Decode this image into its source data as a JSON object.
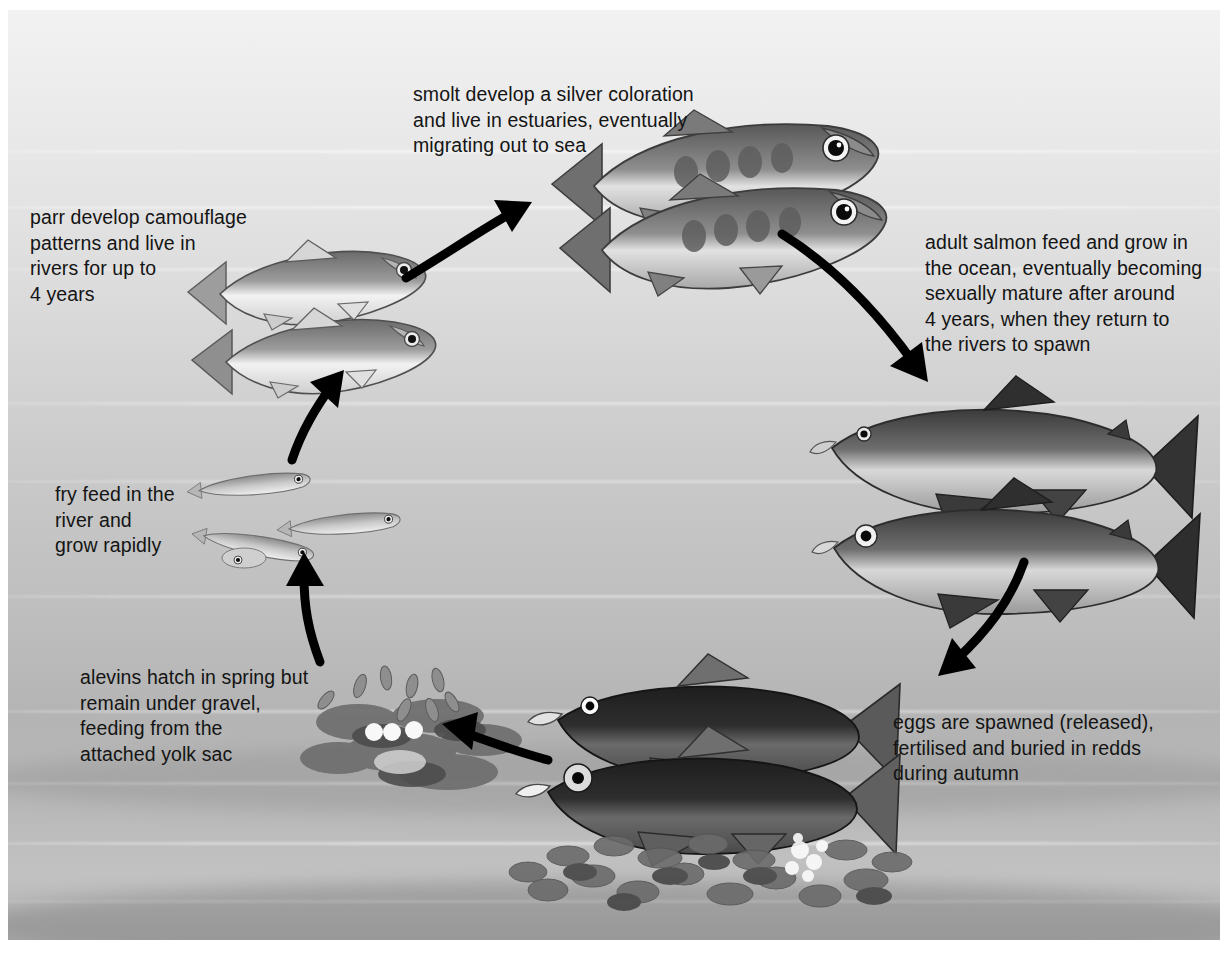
{
  "diagram": {
    "type": "cycle-diagram",
    "background": {
      "description": "underwater scene, grey gradient from pale surface to darker riverbed",
      "top_color": "#f2f2f2",
      "mid_color": "#c9c9c9",
      "bottom_color": "#b0b0b0",
      "wave_color": "#ffffff"
    },
    "arrow_color": "#000000",
    "text_color": "#141414",
    "stages": [
      {
        "id": "smolt",
        "label": "smolt develop a silver coloration\nand live in estuaries, eventually\nmigrating out to sea",
        "subject": "two smolt facing right with oval parr marks",
        "count": 2
      },
      {
        "id": "adult",
        "label": "adult salmon feed and grow in\nthe ocean, eventually becoming\nsexually mature after around\n4 years, when they return to\nthe rivers to spawn",
        "subject": "two large adult salmon facing left, dark backs and silver flanks",
        "count": 2
      },
      {
        "id": "eggs",
        "label": "eggs are spawned (released),\nfertilised and buried in redds\nduring autumn",
        "subject": "two spawning salmon over a gravel redd with eggs",
        "count": 2
      },
      {
        "id": "alevin",
        "label": "alevins hatch in spring but\nremain under gravel,\nfeeding from the\nattached yolk sac",
        "subject": "alevins among gravel with yolk sacs",
        "count": 8
      },
      {
        "id": "fry",
        "label": "fry feed in the\nriver and\ngrow rapidly",
        "subject": "four small slender fry",
        "count": 4
      },
      {
        "id": "parr",
        "label": "parr develop camouflage\npatterns and live in\nrivers for up to\n4 years",
        "subject": "two parr facing right with silvery bellies",
        "count": 2
      }
    ],
    "arrows": [
      {
        "id": "parr-to-smolt",
        "from": "parr",
        "to": "smolt",
        "direction": "up-right"
      },
      {
        "id": "smolt-to-adult",
        "from": "smolt",
        "to": "adult",
        "direction": "down-right"
      },
      {
        "id": "adult-to-eggs",
        "from": "adult",
        "to": "eggs",
        "direction": "down"
      },
      {
        "id": "eggs-to-alevin",
        "from": "eggs",
        "to": "alevin",
        "direction": "up-left"
      },
      {
        "id": "alevin-to-fry",
        "from": "alevin",
        "to": "fry",
        "direction": "up"
      },
      {
        "id": "fry-to-parr",
        "from": "fry",
        "to": "parr",
        "direction": "up-right"
      }
    ]
  }
}
